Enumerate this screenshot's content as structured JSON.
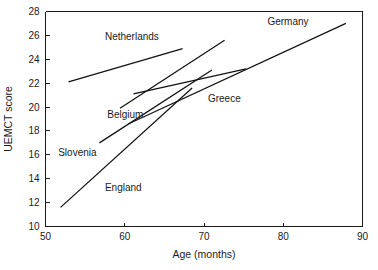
{
  "chart_data": {
    "type": "line",
    "title": "",
    "xlabel": "Age (months)",
    "ylabel": "UEMCT score",
    "xlim": [
      50,
      90
    ],
    "ylim": [
      10,
      28
    ],
    "xticks": [
      50,
      60,
      70,
      80,
      90
    ],
    "yticks": [
      10,
      12,
      14,
      16,
      18,
      20,
      22,
      24,
      26,
      28
    ],
    "xtick_labels": [
      "50",
      "60",
      "70",
      "80",
      "90"
    ],
    "ytick_labels": [
      "10",
      "12",
      "14",
      "16",
      "18",
      "20",
      "22",
      "24",
      "26",
      "28"
    ],
    "grid": false,
    "legend": "inline-annotations",
    "series": [
      {
        "name": "Netherlands",
        "label": "Netherlands",
        "x": [
          52.9,
          67.3
        ],
        "y": [
          22.1,
          24.9
        ],
        "label_x": 57.5,
        "label_y": 25.6
      },
      {
        "name": "Belgium",
        "label": "Belgium",
        "x": [
          59.4,
          72.6
        ],
        "y": [
          19.9,
          25.6
        ],
        "label_x": 57.8,
        "label_y": 19.1
      },
      {
        "name": "Slovenia",
        "label": "Slovenia",
        "x": [
          61.1,
          75.3
        ],
        "y": [
          21.1,
          23.2
        ],
        "label_x": 51.6,
        "label_y": 15.9
      },
      {
        "name": "England",
        "label": "England",
        "x": [
          51.9,
          68.5
        ],
        "y": [
          11.6,
          21.6
        ],
        "label_x": 57.5,
        "label_y": 13.0
      },
      {
        "name": "Greece",
        "label": "Greece",
        "x": [
          56.8,
          71.0
        ],
        "y": [
          17.0,
          23.1
        ],
        "label_x": 70.5,
        "label_y": 20.4
      },
      {
        "name": "Germany",
        "label": "Germany",
        "x": [
          60.5,
          87.9
        ],
        "y": [
          18.6,
          27.0
        ],
        "label_x": 78.0,
        "label_y": 26.9
      }
    ]
  },
  "axis": {
    "x_title": "Age (months)",
    "y_title": "UEMCT score"
  }
}
